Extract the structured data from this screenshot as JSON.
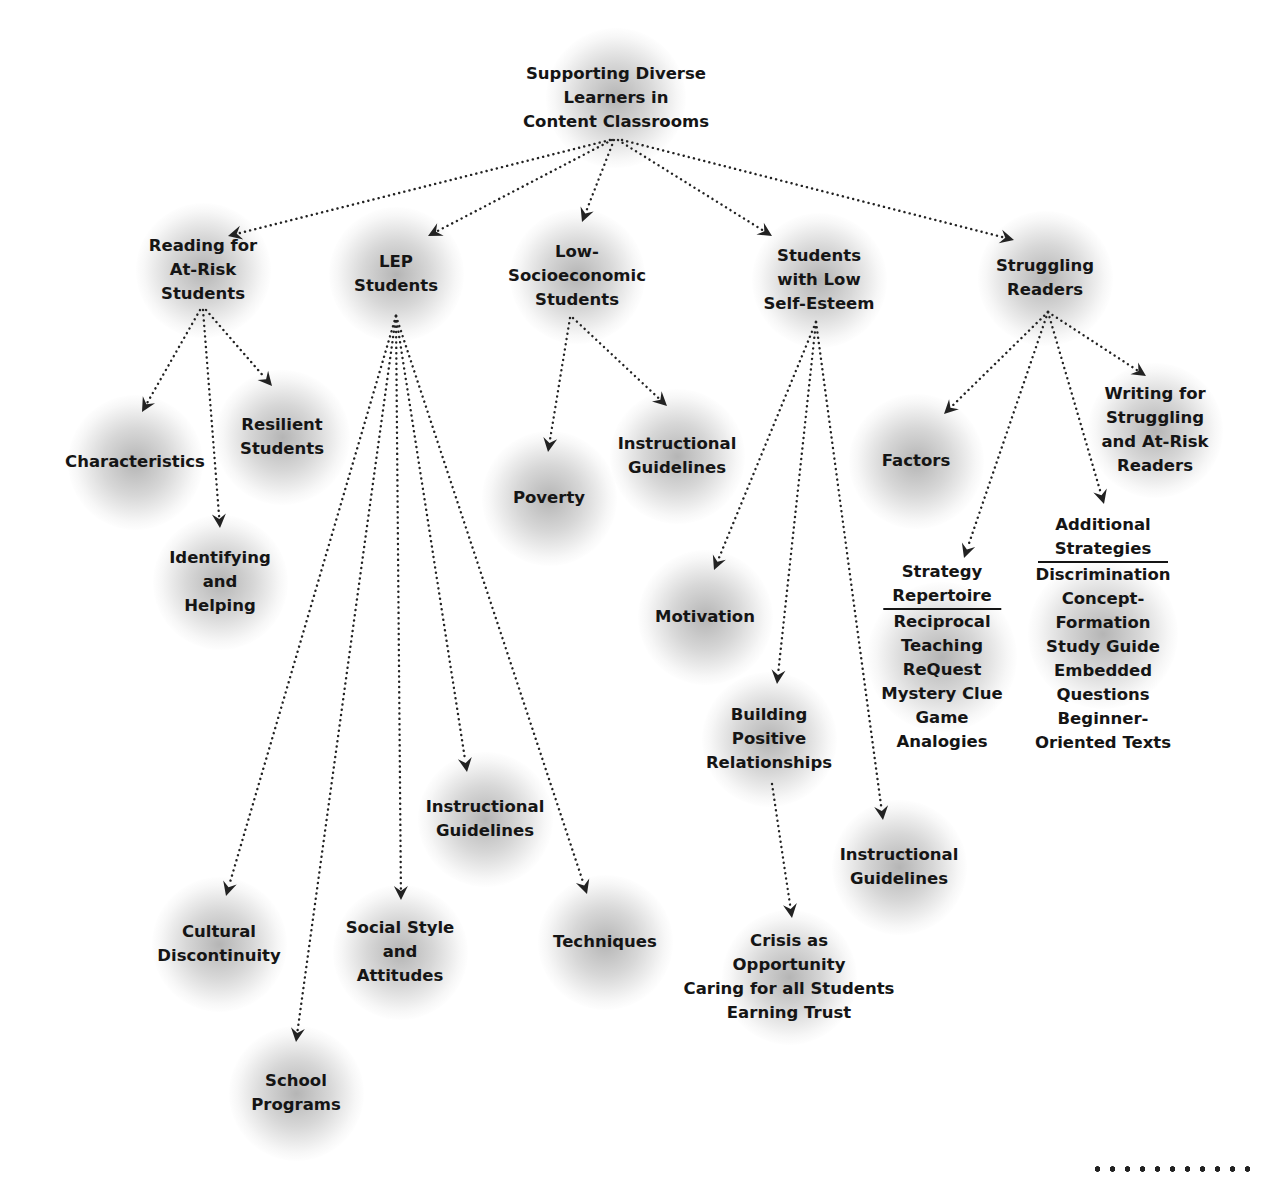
{
  "diagram": {
    "root": {
      "id": "root",
      "label_lines": [
        "Supporting Diverse",
        "Learners in",
        "Content Classrooms"
      ],
      "x": 616,
      "y": 98
    },
    "nodes": [
      {
        "id": "reading-at-risk",
        "label_lines": [
          "Reading for",
          "At-Risk",
          "Students"
        ],
        "x": 203,
        "y": 270
      },
      {
        "id": "lep-students",
        "label_lines": [
          "LEP",
          "Students"
        ],
        "x": 396,
        "y": 274
      },
      {
        "id": "low-socioeconomic",
        "label_lines": [
          "Low-",
          "Socioeconomic",
          "Students"
        ],
        "x": 577,
        "y": 276
      },
      {
        "id": "low-self-esteem",
        "label_lines": [
          "Students",
          "with Low",
          "Self-Esteem"
        ],
        "x": 819,
        "y": 280
      },
      {
        "id": "struggling-readers",
        "label_lines": [
          "Struggling",
          "Readers"
        ],
        "x": 1045,
        "y": 278
      },
      {
        "id": "characteristics",
        "label_lines": [
          "Characteristics"
        ],
        "x": 135,
        "y": 462
      },
      {
        "id": "resilient-students",
        "label_lines": [
          "Resilient",
          "Students"
        ],
        "x": 282,
        "y": 437
      },
      {
        "id": "identifying-helping",
        "label_lines": [
          "Identifying",
          "and",
          "Helping"
        ],
        "x": 220,
        "y": 582
      },
      {
        "id": "lep-cultural-discontinuity",
        "label_lines": [
          "Cultural",
          "Discontinuity"
        ],
        "x": 219,
        "y": 944
      },
      {
        "id": "lep-school-programs",
        "label_lines": [
          "School",
          "Programs"
        ],
        "x": 296,
        "y": 1093
      },
      {
        "id": "lep-social-style",
        "label_lines": [
          "Social Style",
          "and",
          "Attitudes"
        ],
        "x": 400,
        "y": 952
      },
      {
        "id": "lep-instructional-guidelines",
        "label_lines": [
          "Instructional",
          "Guidelines"
        ],
        "x": 485,
        "y": 819
      },
      {
        "id": "lep-techniques",
        "label_lines": [
          "Techniques"
        ],
        "x": 605,
        "y": 942
      },
      {
        "id": "poverty",
        "label_lines": [
          "Poverty"
        ],
        "x": 549,
        "y": 498
      },
      {
        "id": "lowses-instructional-guidelines",
        "label_lines": [
          "Instructional",
          "Guidelines"
        ],
        "x": 677,
        "y": 456
      },
      {
        "id": "motivation",
        "label_lines": [
          "Motivation"
        ],
        "x": 705,
        "y": 617
      },
      {
        "id": "building-positive-relationships",
        "label_lines": [
          "Building",
          "Positive",
          "Relationships"
        ],
        "x": 769,
        "y": 739
      },
      {
        "id": "crisis-opportunity",
        "label_lines": [
          "Crisis as",
          "Opportunity",
          "Caring for all Students",
          "Earning Trust"
        ],
        "x": 789,
        "y": 977
      },
      {
        "id": "selfesteem-instructional-guidelines",
        "label_lines": [
          "Instructional",
          "Guidelines"
        ],
        "x": 899,
        "y": 867
      },
      {
        "id": "factors",
        "label_lines": [
          "Factors"
        ],
        "x": 916,
        "y": 461
      },
      {
        "id": "writing-struggling",
        "label_lines": [
          "Writing for",
          "Struggling",
          "and At-Risk",
          "Readers"
        ],
        "x": 1155,
        "y": 430
      },
      {
        "id": "strategy-repertoire",
        "header_lines": [
          "Strategy",
          "Repertoire"
        ],
        "label_lines": [
          "Reciprocal",
          "Teaching",
          "ReQuest",
          "Mystery Clue",
          "Game",
          "Analogies"
        ],
        "x": 942,
        "y": 657
      },
      {
        "id": "additional-strategies",
        "header_lines": [
          "Additional",
          "Strategies"
        ],
        "label_lines": [
          "Discrimination",
          "Concept-",
          "Formation",
          "Study Guide",
          "Embedded",
          "Questions",
          "Beginner-",
          "Oriented Texts"
        ],
        "x": 1103,
        "y": 634
      }
    ],
    "edges": [
      {
        "from": [
          610,
          140
        ],
        "to": [
          228,
          236
        ]
      },
      {
        "from": [
          612,
          140
        ],
        "to": [
          428,
          236
        ]
      },
      {
        "from": [
          614,
          140
        ],
        "to": [
          582,
          222
        ]
      },
      {
        "from": [
          618,
          140
        ],
        "to": [
          772,
          236
        ]
      },
      {
        "from": [
          622,
          140
        ],
        "to": [
          1014,
          240
        ]
      },
      {
        "from": [
          200,
          310
        ],
        "to": [
          142,
          412
        ]
      },
      {
        "from": [
          203,
          310
        ],
        "to": [
          220,
          528
        ]
      },
      {
        "from": [
          206,
          310
        ],
        "to": [
          272,
          386
        ]
      },
      {
        "from": [
          396,
          316
        ],
        "to": [
          226,
          896
        ]
      },
      {
        "from": [
          396,
          316
        ],
        "to": [
          296,
          1042
        ]
      },
      {
        "from": [
          396,
          316
        ],
        "to": [
          401,
          900
        ]
      },
      {
        "from": [
          396,
          316
        ],
        "to": [
          467,
          772
        ]
      },
      {
        "from": [
          396,
          316
        ],
        "to": [
          587,
          894
        ]
      },
      {
        "from": [
          570,
          318
        ],
        "to": [
          548,
          452
        ]
      },
      {
        "from": [
          573,
          318
        ],
        "to": [
          667,
          406
        ]
      },
      {
        "from": [
          816,
          322
        ],
        "to": [
          714,
          570
        ]
      },
      {
        "from": [
          816,
          322
        ],
        "to": [
          777,
          684
        ]
      },
      {
        "from": [
          816,
          322
        ],
        "to": [
          883,
          820
        ]
      },
      {
        "from": [
          772,
          784
        ],
        "to": [
          792,
          918
        ]
      },
      {
        "from": [
          1048,
          312
        ],
        "to": [
          944,
          414
        ]
      },
      {
        "from": [
          1048,
          312
        ],
        "to": [
          964,
          558
        ]
      },
      {
        "from": [
          1048,
          312
        ],
        "to": [
          1104,
          504
        ]
      },
      {
        "from": [
          1048,
          312
        ],
        "to": [
          1146,
          376
        ]
      }
    ]
  },
  "footer": {
    "decoration": "dotted-rule"
  }
}
